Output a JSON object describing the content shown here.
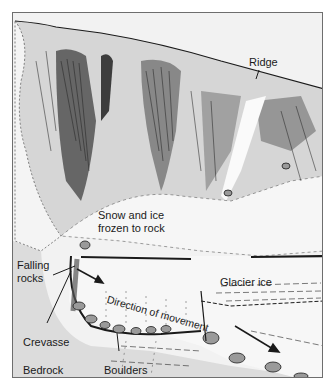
{
  "diagram": {
    "labels": {
      "ridge": "Ridge",
      "snow_ice_line1": "Snow and ice",
      "snow_ice_line2": "frozen to rock",
      "falling_rocks_line1": "Falling",
      "falling_rocks_line2": "rocks",
      "glacier_ice": "Glacier ice",
      "direction": "Direction of movement",
      "crevasse": "Crevasse",
      "bedrock": "Bedrock",
      "boulders": "Boulders"
    },
    "colors": {
      "background": "#ffffff",
      "bedrock_gray": "#dcdcdc",
      "sky": "#f2f2f2",
      "ice": "#f7f7f7",
      "ink": "#1a1a1a",
      "rock_shade": "#bdbdbd"
    }
  }
}
